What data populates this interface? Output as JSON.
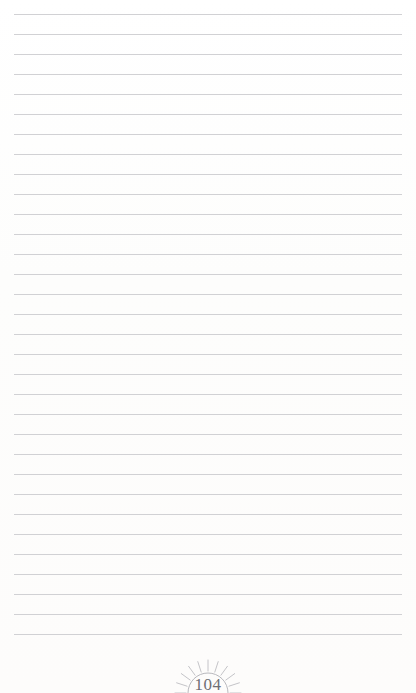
{
  "page": {
    "kind": "ruled-notebook-page",
    "width": 416,
    "height": 693,
    "background_color": "#fefefe",
    "rule_color": "#c9c9cd",
    "rule_count": 32,
    "rule_first_y": 14,
    "rule_spacing": 20,
    "rule_left": 14,
    "rule_right": 402,
    "content_text": ""
  },
  "footer": {
    "page_number": "104",
    "number_color": "#6f6f74",
    "ornament_name": "sunrise-ornament",
    "ornament_color": "#bdbdc2",
    "ray_count": 11,
    "center_x": 208,
    "arc_baseline_y": 688
  }
}
